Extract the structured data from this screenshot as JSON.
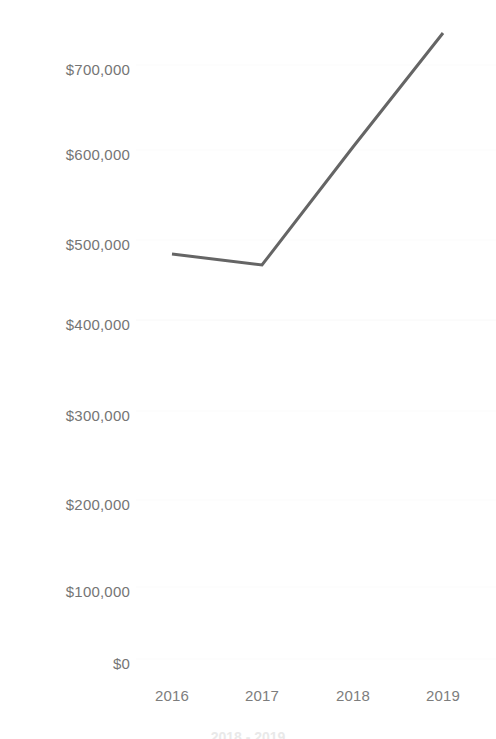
{
  "chart_data": {
    "type": "line",
    "title": "",
    "subtitle": "",
    "xlabel": "",
    "ylabel": "",
    "categories": [
      "2016",
      "2017",
      "2018",
      "2019"
    ],
    "x": [
      2016,
      2017,
      2018,
      2019
    ],
    "values": [
      483000,
      472000,
      610000,
      735000
    ],
    "series": [
      {
        "name": "",
        "values": [
          483000,
          472000,
          610000,
          735000
        ]
      }
    ],
    "ylim": [
      0,
      760000
    ],
    "yticks": [
      0,
      100000,
      200000,
      300000,
      400000,
      500000,
      600000,
      700000
    ],
    "ytick_labels": [
      "$0",
      "$100,000",
      "$200,000",
      "$300,000",
      "$400,000",
      "$500,000",
      "$600,000",
      "$700,000"
    ],
    "xtick_labels": [
      "2016",
      "2017",
      "2018",
      "2019"
    ],
    "grid": true,
    "grid_axis": "y",
    "legend": false,
    "legend_position": "none",
    "annotations": []
  },
  "axes": {
    "y_ticks": [
      {
        "label": "$700,000",
        "value": 700000,
        "y": 69
      },
      {
        "label": "$600,000",
        "value": 600000,
        "y": 154
      },
      {
        "label": "$500,000",
        "value": 500000,
        "y": 244
      },
      {
        "label": "$400,000",
        "value": 400000,
        "y": 324
      },
      {
        "label": "$300,000",
        "value": 300000,
        "y": 415
      },
      {
        "label": "$200,000",
        "value": 200000,
        "y": 504
      },
      {
        "label": "$100,000",
        "value": 100000,
        "y": 591
      },
      {
        "label": "$0",
        "value": 0,
        "y": 663
      }
    ],
    "x_ticks": [
      {
        "label": "2016",
        "x": 172
      },
      {
        "label": "2017",
        "x": 262
      },
      {
        "label": "2018",
        "x": 353
      },
      {
        "label": "2019",
        "x": 443
      }
    ]
  },
  "line_points": [
    {
      "x": 172,
      "y": 254
    },
    {
      "x": 262,
      "y": 265
    },
    {
      "x": 353,
      "y": 147
    },
    {
      "x": 443,
      "y": 33
    }
  ],
  "style": {
    "line_color": "#656565",
    "line_width": 3,
    "text_color": "#757575",
    "xtext_color": "#7d7d7d",
    "grid_color": "#fafafa",
    "background": "#ffffff"
  },
  "footer": {
    "cropped_text": "2018 - 2019"
  }
}
